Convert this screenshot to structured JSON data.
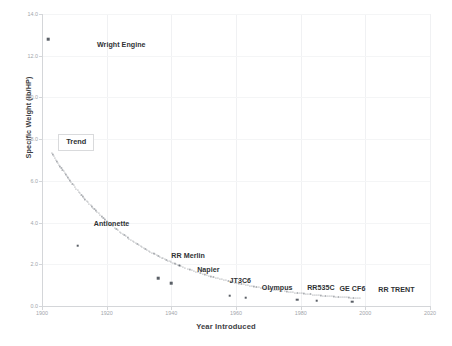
{
  "chart_data": {
    "type": "scatter",
    "title": "",
    "xlabel": "Year Introduced",
    "ylabel": "Specific Weight (lb/HP)",
    "xlim": [
      1900,
      2020
    ],
    "ylim": [
      0.0,
      14.0
    ],
    "xticks": [
      "1900",
      "1920",
      "1940",
      "1960",
      "1980",
      "2000",
      "2020"
    ],
    "yticks": [
      "0.0",
      "2.0",
      "4.0",
      "6.0",
      "8.0",
      "10.0",
      "12.0",
      "14.0"
    ],
    "grid": "both-light",
    "legend_position": "none",
    "annotations": [
      {
        "label": "Wright Engine",
        "x": 1902,
        "y": 12.8,
        "label_x": 1917,
        "label_y": 12.5
      },
      {
        "label": "Antionette",
        "x": 1909,
        "y": 5.2,
        "label_x": 1916,
        "label_y": 3.95
      },
      {
        "label": "RR Merlin",
        "x": 1936,
        "y": 1.35,
        "label_x": 1940,
        "label_y": 2.4
      },
      {
        "label": "Napier",
        "x": 1944,
        "y": 1.05,
        "label_x": 1948,
        "label_y": 1.75
      },
      {
        "label": "JT3C6",
        "x": 1958,
        "y": 0.52,
        "label_x": 1958,
        "label_y": 1.2
      },
      {
        "label": "Olympus",
        "x": 1963,
        "y": 0.42,
        "label_x": 1968,
        "label_y": 0.85
      },
      {
        "label": "RR535C",
        "x": 1979,
        "y": 0.3,
        "label_x": 1982,
        "label_y": 0.85
      },
      {
        "label": "GE CF6",
        "x": 1985,
        "y": 0.27,
        "label_x": 1992,
        "label_y": 0.8
      },
      {
        "label": "RR TRENT",
        "x": 1996,
        "y": 0.22,
        "label_x": 2004,
        "label_y": 0.78
      }
    ],
    "data_points": [
      {
        "name": "Wright Engine",
        "x": 1902,
        "y": 12.8
      },
      {
        "name": "unlabeled-early",
        "x": 1911,
        "y": 2.9
      },
      {
        "name": "RR Merlin",
        "x": 1936,
        "y": 1.32
      },
      {
        "name": "Napier",
        "x": 1940,
        "y": 1.1
      },
      {
        "name": "JT3C6",
        "x": 1958,
        "y": 0.5
      },
      {
        "name": "Olympus",
        "x": 1963,
        "y": 0.4
      },
      {
        "name": "RR535C",
        "x": 1979,
        "y": 0.3
      },
      {
        "name": "GE CF6",
        "x": 1985,
        "y": 0.26
      },
      {
        "name": "RR TRENT",
        "x": 1996,
        "y": 0.2
      }
    ],
    "trend": {
      "label": "Trend",
      "style": "dotted",
      "description": "power-law decay fitted through engine specific weight points",
      "x": [
        1903,
        1905,
        1907,
        1909,
        1911,
        1913,
        1915,
        1917,
        1919,
        1921,
        1923,
        1925,
        1927,
        1929,
        1931,
        1933,
        1935,
        1937,
        1939,
        1941,
        1943,
        1945,
        1947,
        1949,
        1951,
        1953,
        1955,
        1957,
        1959,
        1961,
        1963,
        1965,
        1967,
        1969,
        1971,
        1973,
        1975,
        1977,
        1979,
        1981,
        1983,
        1985,
        1987,
        1989,
        1991,
        1993,
        1995,
        1997,
        1999
      ],
      "y": [
        7.35,
        6.85,
        6.38,
        5.95,
        5.55,
        5.18,
        4.84,
        4.52,
        4.22,
        3.95,
        3.69,
        3.45,
        3.23,
        3.02,
        2.83,
        2.65,
        2.48,
        2.32,
        2.18,
        2.04,
        1.91,
        1.79,
        1.68,
        1.58,
        1.48,
        1.39,
        1.31,
        1.23,
        1.15,
        1.08,
        1.02,
        0.96,
        0.9,
        0.85,
        0.8,
        0.75,
        0.71,
        0.67,
        0.63,
        0.6,
        0.56,
        0.53,
        0.5,
        0.48,
        0.45,
        0.43,
        0.41,
        0.39,
        0.37
      ]
    },
    "trend_callout": {
      "label": "Trend",
      "box_x": 1905,
      "box_y": 7.9
    }
  }
}
